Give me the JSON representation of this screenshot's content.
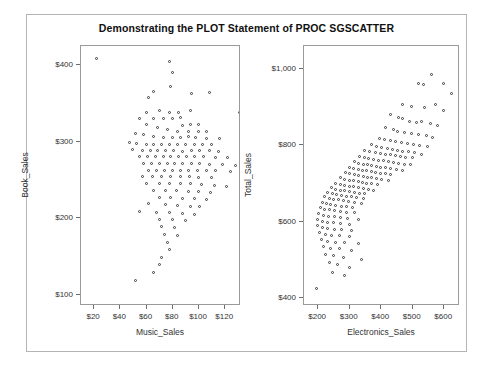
{
  "graph": {
    "title": "Demonstrating the PLOT Statement of PROC SGSCATTER",
    "frame_color": "#b4b4b4",
    "axis_color": "#9a9a9a",
    "marker_color": "#3a3a3a",
    "background": "#ffffff"
  },
  "chart_data": [
    {
      "type": "scatter",
      "title": "Demonstrating the PLOT Statement of PROC SGSCATTER",
      "panel": "left",
      "xlabel": "Music_Sales",
      "ylabel": "Book_Sales",
      "xticks": [
        "$20",
        "$40",
        "$60",
        "$80",
        "$100",
        "$120"
      ],
      "xtick_values": [
        20,
        40,
        60,
        80,
        100,
        120
      ],
      "yticks": [
        "$100",
        "$200",
        "$300",
        "$400"
      ],
      "ytick_values": [
        100,
        200,
        300,
        400
      ],
      "xlim": [
        10,
        132
      ],
      "ylim": [
        85,
        425
      ],
      "grid": false,
      "legend": "none",
      "marker": "open-circle",
      "points": [
        [
          22,
          408
        ],
        [
          78,
          404
        ],
        [
          80,
          390
        ],
        [
          79,
          372
        ],
        [
          66,
          365
        ],
        [
          62,
          357
        ],
        [
          95,
          362
        ],
        [
          108,
          363
        ],
        [
          131,
          338
        ],
        [
          60,
          338
        ],
        [
          70,
          340
        ],
        [
          78,
          338
        ],
        [
          85,
          338
        ],
        [
          94,
          340
        ],
        [
          55,
          330
        ],
        [
          66,
          330
        ],
        [
          73,
          330
        ],
        [
          80,
          330
        ],
        [
          86,
          331
        ],
        [
          60,
          322
        ],
        [
          88,
          320
        ],
        [
          94,
          322
        ],
        [
          100,
          322
        ],
        [
          69,
          318
        ],
        [
          76,
          315
        ],
        [
          84,
          312
        ],
        [
          92,
          312
        ],
        [
          100,
          313
        ],
        [
          106,
          312
        ],
        [
          52,
          310
        ],
        [
          58,
          308
        ],
        [
          66,
          306
        ],
        [
          73,
          305
        ],
        [
          80,
          305
        ],
        [
          86,
          305
        ],
        [
          92,
          306
        ],
        [
          98,
          305
        ],
        [
          106,
          304
        ],
        [
          116,
          303
        ],
        [
          47,
          298
        ],
        [
          53,
          297
        ],
        [
          60,
          296
        ],
        [
          66,
          296
        ],
        [
          72,
          296
        ],
        [
          78,
          296
        ],
        [
          84,
          296
        ],
        [
          90,
          295
        ],
        [
          97,
          295
        ],
        [
          103,
          296
        ],
        [
          110,
          296
        ],
        [
          50,
          289
        ],
        [
          57,
          288
        ],
        [
          63,
          288
        ],
        [
          69,
          288
        ],
        [
          75,
          288
        ],
        [
          81,
          288
        ],
        [
          88,
          287
        ],
        [
          95,
          288
        ],
        [
          101,
          288
        ],
        [
          108,
          288
        ],
        [
          115,
          287
        ],
        [
          55,
          280
        ],
        [
          61,
          280
        ],
        [
          67,
          280
        ],
        [
          73,
          280
        ],
        [
          79,
          280
        ],
        [
          85,
          280
        ],
        [
          91,
          280
        ],
        [
          97,
          280
        ],
        [
          104,
          280
        ],
        [
          113,
          279
        ],
        [
          122,
          278
        ],
        [
          58,
          271
        ],
        [
          64,
          271
        ],
        [
          70,
          271
        ],
        [
          76,
          271
        ],
        [
          82,
          271
        ],
        [
          88,
          271
        ],
        [
          95,
          271
        ],
        [
          101,
          271
        ],
        [
          108,
          270
        ],
        [
          118,
          270
        ],
        [
          128,
          268
        ],
        [
          62,
          262
        ],
        [
          68,
          262
        ],
        [
          74,
          262
        ],
        [
          80,
          262
        ],
        [
          86,
          262
        ],
        [
          92,
          262
        ],
        [
          99,
          262
        ],
        [
          106,
          261
        ],
        [
          113,
          261
        ],
        [
          124,
          260
        ],
        [
          57,
          254
        ],
        [
          65,
          254
        ],
        [
          72,
          254
        ],
        [
          79,
          254
        ],
        [
          86,
          254
        ],
        [
          93,
          254
        ],
        [
          100,
          253
        ],
        [
          110,
          252
        ],
        [
          60,
          245
        ],
        [
          70,
          245
        ],
        [
          78,
          244
        ],
        [
          86,
          244
        ],
        [
          94,
          244
        ],
        [
          102,
          243
        ],
        [
          112,
          242
        ],
        [
          121,
          241
        ],
        [
          66,
          236
        ],
        [
          75,
          235
        ],
        [
          83,
          235
        ],
        [
          92,
          234
        ],
        [
          100,
          234
        ],
        [
          109,
          233
        ],
        [
          70,
          226
        ],
        [
          79,
          226
        ],
        [
          88,
          225
        ],
        [
          97,
          225
        ],
        [
          106,
          224
        ],
        [
          62,
          218
        ],
        [
          75,
          217
        ],
        [
          84,
          216
        ],
        [
          94,
          215
        ],
        [
          101,
          214
        ],
        [
          55,
          208
        ],
        [
          68,
          207
        ],
        [
          78,
          206
        ],
        [
          88,
          205
        ],
        [
          97,
          204
        ],
        [
          70,
          198
        ],
        [
          80,
          197
        ],
        [
          90,
          196
        ],
        [
          72,
          188
        ],
        [
          82,
          187
        ],
        [
          74,
          178
        ],
        [
          84,
          177
        ],
        [
          76,
          168
        ],
        [
          78,
          158
        ],
        [
          72,
          148
        ],
        [
          70,
          138
        ],
        [
          66,
          128
        ],
        [
          52,
          118
        ]
      ]
    },
    {
      "type": "scatter",
      "panel": "right",
      "xlabel": "Electronics_Sales",
      "ylabel": "Total_Sales",
      "xticks": [
        "$200",
        "$300",
        "$400",
        "$500",
        "$600"
      ],
      "xtick_values": [
        200,
        300,
        400,
        500,
        600
      ],
      "yticks": [
        "$400",
        "$600",
        "$800",
        "$1,000"
      ],
      "ytick_values": [
        400,
        600,
        800,
        1000
      ],
      "xlim": [
        155,
        650
      ],
      "ylim": [
        380,
        1060
      ],
      "grid": false,
      "legend": "none",
      "marker": "open-circle",
      "correlation": "positive",
      "points": [
        [
          560,
          985
        ],
        [
          520,
          960
        ],
        [
          535,
          958
        ],
        [
          600,
          960
        ],
        [
          625,
          935
        ],
        [
          470,
          905
        ],
        [
          498,
          900
        ],
        [
          540,
          898
        ],
        [
          575,
          905
        ],
        [
          600,
          890
        ],
        [
          430,
          880
        ],
        [
          455,
          872
        ],
        [
          468,
          868
        ],
        [
          490,
          862
        ],
        [
          512,
          858
        ],
        [
          530,
          862
        ],
        [
          558,
          856
        ],
        [
          580,
          852
        ],
        [
          415,
          845
        ],
        [
          440,
          840
        ],
        [
          452,
          836
        ],
        [
          476,
          832
        ],
        [
          498,
          830
        ],
        [
          520,
          828
        ],
        [
          545,
          824
        ],
        [
          565,
          820
        ],
        [
          395,
          818
        ],
        [
          412,
          814
        ],
        [
          432,
          812
        ],
        [
          448,
          810
        ],
        [
          466,
          806
        ],
        [
          484,
          804
        ],
        [
          504,
          800
        ],
        [
          524,
          798
        ],
        [
          548,
          796
        ],
        [
          372,
          800
        ],
        [
          388,
          796
        ],
        [
          402,
          792
        ],
        [
          420,
          790
        ],
        [
          436,
          788
        ],
        [
          452,
          786
        ],
        [
          470,
          784
        ],
        [
          488,
          782
        ],
        [
          508,
          780
        ],
        [
          530,
          776
        ],
        [
          350,
          786
        ],
        [
          366,
          782
        ],
        [
          382,
          780
        ],
        [
          398,
          778
        ],
        [
          414,
          776
        ],
        [
          430,
          774
        ],
        [
          446,
          772
        ],
        [
          462,
          770
        ],
        [
          480,
          768
        ],
        [
          500,
          766
        ],
        [
          332,
          770
        ],
        [
          348,
          766
        ],
        [
          362,
          764
        ],
        [
          378,
          762
        ],
        [
          394,
          760
        ],
        [
          410,
          758
        ],
        [
          426,
          756
        ],
        [
          442,
          754
        ],
        [
          458,
          752
        ],
        [
          476,
          750
        ],
        [
          496,
          748
        ],
        [
          316,
          756
        ],
        [
          330,
          752
        ],
        [
          344,
          750
        ],
        [
          358,
          748
        ],
        [
          372,
          746
        ],
        [
          386,
          744
        ],
        [
          400,
          742
        ],
        [
          416,
          740
        ],
        [
          432,
          738
        ],
        [
          450,
          736
        ],
        [
          470,
          734
        ],
        [
          300,
          742
        ],
        [
          314,
          738
        ],
        [
          328,
          736
        ],
        [
          342,
          734
        ],
        [
          356,
          732
        ],
        [
          370,
          730
        ],
        [
          384,
          728
        ],
        [
          398,
          726
        ],
        [
          414,
          724
        ],
        [
          432,
          722
        ],
        [
          288,
          728
        ],
        [
          302,
          724
        ],
        [
          316,
          722
        ],
        [
          330,
          720
        ],
        [
          344,
          718
        ],
        [
          358,
          716
        ],
        [
          372,
          714
        ],
        [
          388,
          712
        ],
        [
          404,
          710
        ],
        [
          424,
          708
        ],
        [
          272,
          714
        ],
        [
          286,
          710
        ],
        [
          300,
          708
        ],
        [
          314,
          706
        ],
        [
          328,
          704
        ],
        [
          342,
          702
        ],
        [
          356,
          700
        ],
        [
          372,
          698
        ],
        [
          390,
          696
        ],
        [
          258,
          700
        ],
        [
          272,
          696
        ],
        [
          286,
          694
        ],
        [
          300,
          692
        ],
        [
          314,
          690
        ],
        [
          328,
          688
        ],
        [
          344,
          686
        ],
        [
          360,
          684
        ],
        [
          378,
          682
        ],
        [
          244,
          688
        ],
        [
          258,
          684
        ],
        [
          272,
          682
        ],
        [
          286,
          680
        ],
        [
          300,
          678
        ],
        [
          316,
          676
        ],
        [
          332,
          674
        ],
        [
          350,
          672
        ],
        [
          232,
          676
        ],
        [
          246,
          672
        ],
        [
          260,
          670
        ],
        [
          274,
          668
        ],
        [
          290,
          666
        ],
        [
          306,
          664
        ],
        [
          324,
          662
        ],
        [
          344,
          660
        ],
        [
          222,
          664
        ],
        [
          236,
          660
        ],
        [
          250,
          658
        ],
        [
          266,
          656
        ],
        [
          282,
          654
        ],
        [
          298,
          652
        ],
        [
          316,
          650
        ],
        [
          338,
          648
        ],
        [
          214,
          650
        ],
        [
          228,
          646
        ],
        [
          242,
          644
        ],
        [
          258,
          642
        ],
        [
          274,
          640
        ],
        [
          292,
          638
        ],
        [
          312,
          636
        ],
        [
          208,
          636
        ],
        [
          222,
          632
        ],
        [
          238,
          630
        ],
        [
          254,
          628
        ],
        [
          272,
          626
        ],
        [
          292,
          624
        ],
        [
          316,
          622
        ],
        [
          204,
          620
        ],
        [
          218,
          616
        ],
        [
          234,
          614
        ],
        [
          252,
          612
        ],
        [
          272,
          610
        ],
        [
          296,
          608
        ],
        [
          328,
          606
        ],
        [
          200,
          604
        ],
        [
          216,
          600
        ],
        [
          232,
          598
        ],
        [
          250,
          596
        ],
        [
          272,
          594
        ],
        [
          300,
          592
        ],
        [
          198,
          588
        ],
        [
          214,
          584
        ],
        [
          232,
          582
        ],
        [
          252,
          580
        ],
        [
          276,
          578
        ],
        [
          306,
          576
        ],
        [
          206,
          570
        ],
        [
          224,
          566
        ],
        [
          244,
          564
        ],
        [
          268,
          562
        ],
        [
          300,
          560
        ],
        [
          212,
          552
        ],
        [
          232,
          548
        ],
        [
          256,
          546
        ],
        [
          286,
          544
        ],
        [
          330,
          542
        ],
        [
          218,
          534
        ],
        [
          240,
          530
        ],
        [
          268,
          528
        ],
        [
          306,
          524
        ],
        [
          226,
          514
        ],
        [
          250,
          510
        ],
        [
          282,
          506
        ],
        [
          340,
          500
        ],
        [
          236,
          492
        ],
        [
          264,
          486
        ],
        [
          300,
          480
        ],
        [
          248,
          466
        ],
        [
          286,
          458
        ],
        [
          196,
          424
        ]
      ]
    }
  ]
}
